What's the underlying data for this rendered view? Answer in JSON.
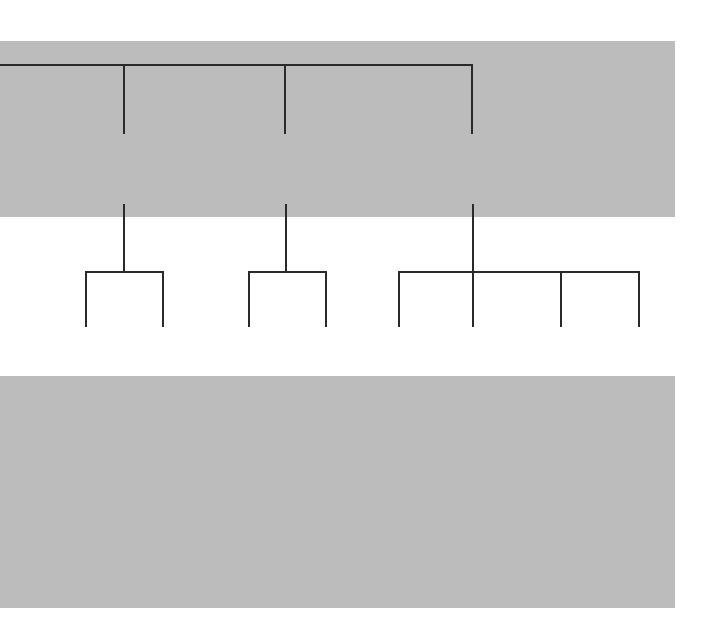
{
  "diagram": {
    "type": "work-breakdown-structure",
    "colors": {
      "band": "#bcbcbc",
      "line": "#2a2a2a",
      "box": "#ffffff"
    },
    "level1": [
      {
        "id": "5",
        "title": "Entertainment",
        "owner": "Jeff"
      },
      {
        "id": "6",
        "title": "Food",
        "owner": "Bill"
      },
      {
        "id": "7",
        "title": "Services",
        "owner": "Jack"
      }
    ],
    "level2": [
      {
        "id": "5.1",
        "title": "Performers",
        "owner": "Jeff"
      },
      {
        "id": "5.2",
        "title": "Grandstand",
        "owner": "Jim"
      },
      {
        "id": "6.1",
        "title": "Food",
        "owner": "Bill"
      },
      {
        "id": "6.2",
        "title": "Facilities",
        "owner": "Chris"
      },
      {
        "id": "7.1",
        "title": "Parking",
        "owner": "Steve"
      },
      {
        "id": "7.2",
        "title": "Clean-up",
        "owner": "Tyler"
      },
      {
        "id": "7.3",
        "title": "Restroom\nFacilities",
        "owner": "Jack"
      },
      {
        "id": "7.4",
        "title": "Security",
        "owner": "Rose"
      }
    ],
    "level3": [
      {
        "id": "5.2.1",
        "title": "Stage",
        "owner": "Jim"
      },
      {
        "id": "5.2.2",
        "title": "Audio &\nLighting",
        "owner": "Joe"
      },
      {
        "id": "5.2.3",
        "title": "Seating",
        "owner": "Jim"
      },
      {
        "id": "6.2.1",
        "title": "Food\nBooths",
        "owner": "Chris"
      },
      {
        "id": "6.2.2",
        "title": "Cooking\nEquipment",
        "owner": "Bill"
      },
      {
        "id": "6.2.3",
        "title": "Eating\nAreas",
        "owner": "Jim"
      },
      {
        "id": "7.2.1",
        "title": "Containers",
        "owner": "Tyler"
      },
      {
        "id": "7.2.2",
        "title": "Contractor",
        "owner": "Damian"
      },
      {
        "id": "7.3.1",
        "title": "Restrooms",
        "owner": "Jack"
      },
      {
        "id": "7.3.2",
        "title": "First Aid\nStation",
        "owner": "Beth"
      }
    ]
  }
}
